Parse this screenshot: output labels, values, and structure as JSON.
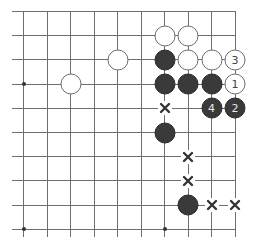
{
  "diagram": {
    "type": "go-board-fragment",
    "grid": {
      "columns": 10,
      "rows": 10,
      "edges": [
        "top",
        "right"
      ],
      "line_color": "#6e6e6e"
    },
    "hoshi": [
      {
        "col": 0,
        "row": 3
      },
      {
        "col": 0,
        "row": 9
      },
      {
        "col": 6,
        "row": 9
      }
    ],
    "stones": [
      {
        "color": "white",
        "col": 6,
        "row": 1,
        "label": ""
      },
      {
        "color": "white",
        "col": 7,
        "row": 1,
        "label": ""
      },
      {
        "color": "white",
        "col": 4,
        "row": 2,
        "label": ""
      },
      {
        "color": "black",
        "col": 6,
        "row": 2,
        "label": ""
      },
      {
        "color": "white",
        "col": 7,
        "row": 2,
        "label": ""
      },
      {
        "color": "white",
        "col": 8,
        "row": 2,
        "label": ""
      },
      {
        "color": "white",
        "col": 9,
        "row": 2,
        "label": "3"
      },
      {
        "color": "white",
        "col": 2,
        "row": 3,
        "label": ""
      },
      {
        "color": "black",
        "col": 6,
        "row": 3,
        "label": ""
      },
      {
        "color": "black",
        "col": 7,
        "row": 3,
        "label": ""
      },
      {
        "color": "black",
        "col": 8,
        "row": 3,
        "label": ""
      },
      {
        "color": "white",
        "col": 9,
        "row": 3,
        "label": "1"
      },
      {
        "color": "black",
        "col": 8,
        "row": 4,
        "label": "4"
      },
      {
        "color": "black",
        "col": 9,
        "row": 4,
        "label": "2"
      },
      {
        "color": "black",
        "col": 6,
        "row": 5,
        "label": ""
      },
      {
        "color": "black",
        "col": 7,
        "row": 8,
        "label": ""
      }
    ],
    "marks": [
      {
        "symbol": "x-icon",
        "col": 6,
        "row": 4
      },
      {
        "symbol": "x-icon",
        "col": 7,
        "row": 6
      },
      {
        "symbol": "x-icon",
        "col": 7,
        "row": 7
      },
      {
        "symbol": "x-icon",
        "col": 8,
        "row": 8
      },
      {
        "symbol": "x-icon",
        "col": 9,
        "row": 8
      }
    ]
  }
}
